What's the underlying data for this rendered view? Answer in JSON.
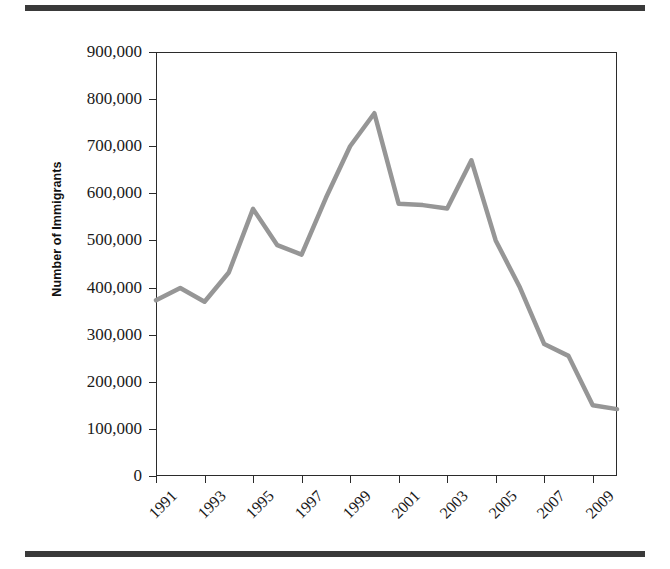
{
  "figure": {
    "separator_color": "#3a3a3a",
    "background": "#ffffff"
  },
  "chart_data": {
    "type": "line",
    "title": "",
    "xlabel": "",
    "ylabel": "Number of Immigrants",
    "line_color": "#969696",
    "axis_color": "#2b2b2b",
    "grid": false,
    "legend": false,
    "ylim": [
      0,
      900000
    ],
    "xlim": [
      1991,
      2010
    ],
    "ytick_labels": [
      "900,000",
      "800,000",
      "700,000",
      "600,000",
      "500,000",
      "400,000",
      "300,000",
      "200,000",
      "100,000",
      "0"
    ],
    "ytick_values": [
      900000,
      800000,
      700000,
      600000,
      500000,
      400000,
      300000,
      200000,
      100000,
      0
    ],
    "xtick_labels": [
      "1991",
      "1993",
      "1995",
      "1997",
      "1999",
      "2001",
      "2003",
      "2005",
      "2007",
      "2009"
    ],
    "xtick_values": [
      1991,
      1993,
      1995,
      1997,
      1999,
      2001,
      2003,
      2005,
      2007,
      2009
    ],
    "x": [
      1991,
      1992,
      1993,
      1994,
      1995,
      1996,
      1997,
      1998,
      1999,
      2000,
      2001,
      2002,
      2003,
      2004,
      2005,
      2006,
      2007,
      2008,
      2009,
      2010
    ],
    "values": [
      373000,
      399000,
      370000,
      432000,
      567000,
      490000,
      470000,
      590000,
      700000,
      770000,
      578000,
      575000,
      568000,
      670000,
      500000,
      400000,
      280000,
      255000,
      150000,
      142000
    ]
  }
}
